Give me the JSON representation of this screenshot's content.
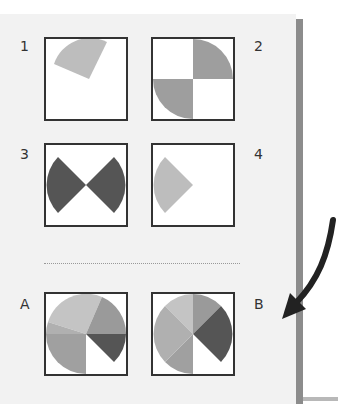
{
  "puzzle": {
    "sequence": [
      {
        "label": "1",
        "description": "light gray sector at top"
      },
      {
        "label": "2",
        "description": "two medium gray quarter circles at top-right and bottom-left"
      },
      {
        "label": "3",
        "description": "two dark gray sectors left and right forming bowtie"
      },
      {
        "label": "4",
        "description": "light gray sector on left"
      }
    ],
    "options": [
      {
        "label": "A",
        "description": "pie with multiple gray sectors, white gap lower-right"
      },
      {
        "label": "B",
        "description": "pie with multiple gray sectors, white gap lower-middle"
      }
    ]
  },
  "colors": {
    "light": "#bdbdbd",
    "medium": "#9e9e9e",
    "dark": "#555555",
    "border": "#333333",
    "background": "#f2f2f2"
  },
  "annotation": {
    "icon": "curved-arrow-icon",
    "points_to": "B"
  }
}
